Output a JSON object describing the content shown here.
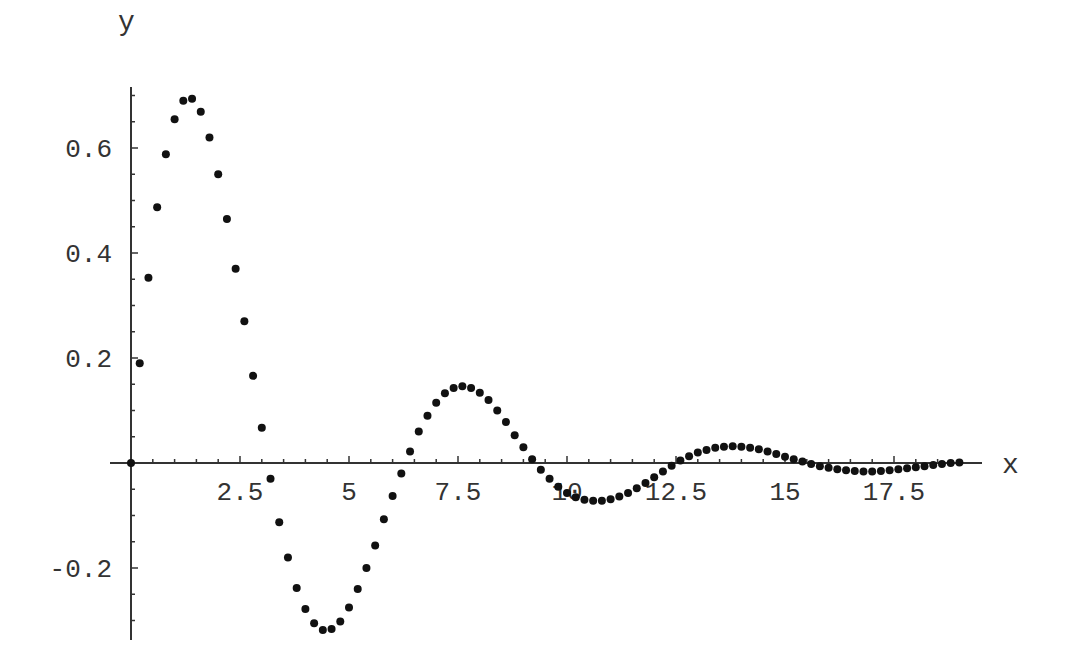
{
  "chart_data": {
    "type": "scatter",
    "title": "",
    "xlabel": "x",
    "ylabel": "y",
    "xlim": [
      0,
      19.5
    ],
    "ylim": [
      -0.33,
      0.72
    ],
    "grid": false,
    "legend": null,
    "x_ticks": [
      {
        "value": 2.5,
        "label": "2.5"
      },
      {
        "value": 5,
        "label": "5"
      },
      {
        "value": 7.5,
        "label": "7.5"
      },
      {
        "value": 10,
        "label": "10"
      },
      {
        "value": 12.5,
        "label": "12.5"
      },
      {
        "value": 15,
        "label": "15"
      },
      {
        "value": 17.5,
        "label": "17.5"
      }
    ],
    "y_ticks": [
      {
        "value": 0.6,
        "label": "0.6"
      },
      {
        "value": 0.4,
        "label": "0.4"
      },
      {
        "value": 0.2,
        "label": "0.2"
      },
      {
        "value": -0.2,
        "label": "-0.2"
      }
    ],
    "x_minor_step": 0.5,
    "y_minor_step": 0.05,
    "point_color": "#111111",
    "axis_color": "#333333",
    "series": [
      {
        "name": "y",
        "points": [
          [
            0,
            0
          ],
          [
            0.2,
            0.19
          ],
          [
            0.4,
            0.353
          ],
          [
            0.6,
            0.487
          ],
          [
            0.8,
            0.588
          ],
          [
            1.0,
            0.655
          ],
          [
            1.2,
            0.69
          ],
          [
            1.4,
            0.694
          ],
          [
            1.6,
            0.669
          ],
          [
            1.8,
            0.62
          ],
          [
            2.0,
            0.55
          ],
          [
            2.2,
            0.465
          ],
          [
            2.4,
            0.37
          ],
          [
            2.6,
            0.27
          ],
          [
            2.8,
            0.166
          ],
          [
            3.0,
            0.067
          ],
          [
            3.2,
            -0.03
          ],
          [
            3.4,
            -0.113
          ],
          [
            3.6,
            -0.18
          ],
          [
            3.8,
            -0.238
          ],
          [
            4.0,
            -0.278
          ],
          [
            4.2,
            -0.305
          ],
          [
            4.4,
            -0.318
          ],
          [
            4.6,
            -0.316
          ],
          [
            4.8,
            -0.302
          ],
          [
            5.0,
            -0.275
          ],
          [
            5.2,
            -0.24
          ],
          [
            5.4,
            -0.2
          ],
          [
            5.6,
            -0.157
          ],
          [
            5.8,
            -0.107
          ],
          [
            6.0,
            -0.063
          ],
          [
            6.2,
            -0.02
          ],
          [
            6.4,
            0.022
          ],
          [
            6.6,
            0.06
          ],
          [
            6.8,
            0.09
          ],
          [
            7.0,
            0.115
          ],
          [
            7.2,
            0.133
          ],
          [
            7.4,
            0.143
          ],
          [
            7.6,
            0.146
          ],
          [
            7.8,
            0.143
          ],
          [
            8.0,
            0.134
          ],
          [
            8.2,
            0.12
          ],
          [
            8.4,
            0.1
          ],
          [
            8.6,
            0.078
          ],
          [
            8.8,
            0.053
          ],
          [
            9.0,
            0.03
          ],
          [
            9.2,
            0.007
          ],
          [
            9.4,
            -0.013
          ],
          [
            9.6,
            -0.03
          ],
          [
            9.8,
            -0.045
          ],
          [
            10.0,
            -0.057
          ],
          [
            10.2,
            -0.065
          ],
          [
            10.4,
            -0.07
          ],
          [
            10.6,
            -0.072
          ],
          [
            10.8,
            -0.072
          ],
          [
            11.0,
            -0.069
          ],
          [
            11.2,
            -0.064
          ],
          [
            11.4,
            -0.057
          ],
          [
            11.6,
            -0.048
          ],
          [
            11.8,
            -0.038
          ],
          [
            12.0,
            -0.027
          ],
          [
            12.2,
            -0.016
          ],
          [
            12.4,
            -0.005
          ],
          [
            12.6,
            0.005
          ],
          [
            12.8,
            0.013
          ],
          [
            13.0,
            0.02
          ],
          [
            13.2,
            0.025
          ],
          [
            13.4,
            0.029
          ],
          [
            13.6,
            0.031
          ],
          [
            13.8,
            0.032
          ],
          [
            14.0,
            0.031
          ],
          [
            14.2,
            0.029
          ],
          [
            14.4,
            0.026
          ],
          [
            14.6,
            0.022
          ],
          [
            14.8,
            0.017
          ],
          [
            15.0,
            0.012
          ],
          [
            15.2,
            0.007
          ],
          [
            15.4,
            0.003
          ],
          [
            15.6,
            -0.002
          ],
          [
            15.8,
            -0.006
          ],
          [
            16.0,
            -0.009
          ],
          [
            16.2,
            -0.012
          ],
          [
            16.4,
            -0.014
          ],
          [
            16.6,
            -0.015
          ],
          [
            16.8,
            -0.016
          ],
          [
            17.0,
            -0.016
          ],
          [
            17.2,
            -0.015
          ],
          [
            17.4,
            -0.014
          ],
          [
            17.6,
            -0.012
          ],
          [
            17.8,
            -0.01
          ],
          [
            18.0,
            -0.008
          ],
          [
            18.2,
            -0.006
          ],
          [
            18.4,
            -0.004
          ],
          [
            18.6,
            -0.002
          ],
          [
            18.8,
            0.0
          ],
          [
            19.0,
            0.001
          ]
        ]
      }
    ]
  }
}
